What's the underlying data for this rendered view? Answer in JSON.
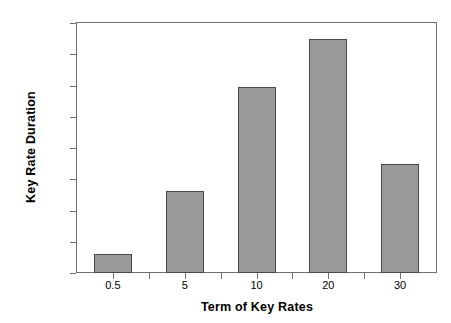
{
  "chart_data": {
    "type": "bar",
    "title": "",
    "xlabel": "Term of Key Rates",
    "ylabel": "Key Rate Duration",
    "categories": [
      "0.5",
      "5",
      "10",
      "20",
      "30"
    ],
    "values": [
      0.3,
      1.32,
      2.98,
      3.75,
      1.74
    ],
    "series": [
      {
        "name": "Key Rate Duration",
        "values": [
          0.3,
          1.32,
          2.98,
          3.75,
          1.74
        ]
      }
    ],
    "ylim": [
      0,
      4
    ],
    "xlim_categories": 5,
    "ytick_labels": [
      "0",
      "0.5",
      "1",
      "1.5",
      "2",
      "2.5",
      "3",
      "3.5",
      "4"
    ],
    "ytick_values": [
      0,
      0.5,
      1,
      1.5,
      2,
      2.5,
      3,
      3.5,
      4
    ],
    "xtick_labels": [
      "0.5",
      "5",
      "10",
      "20",
      "30"
    ],
    "grid": false,
    "legend": false,
    "legend_position": "none",
    "colors": {
      "bar_fill": "#9a9a9a",
      "bar_border": "#4a4a4a",
      "axis": "#6f6f6f",
      "text": "#000000",
      "background": "#ffffff"
    }
  }
}
